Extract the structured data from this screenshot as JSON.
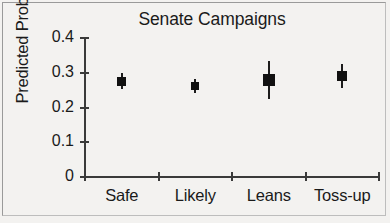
{
  "figure": {
    "title": "Senate Campaigns",
    "ylabel": "Predicted Probability"
  },
  "axes": {
    "y_ticks": [
      "0.4",
      "0.3",
      "0.2",
      "0.1",
      "0"
    ],
    "x_ticks": [
      "Safe",
      "Likely",
      "Leans",
      "Toss-up"
    ]
  },
  "chart_data": {
    "type": "scatter",
    "title": "Senate Campaigns",
    "subtitle": "",
    "xlabel": "",
    "ylabel": "Predicted Probability",
    "categories": [
      "Safe",
      "Likely",
      "Leans",
      "Toss-up"
    ],
    "values": [
      0.275,
      0.262,
      0.278,
      0.29
    ],
    "error_low": [
      0.253,
      0.243,
      0.225,
      0.255
    ],
    "error_high": [
      0.298,
      0.283,
      0.335,
      0.325
    ],
    "ylim": [
      0,
      0.4
    ],
    "ytick_values": [
      0,
      0.1,
      0.2,
      0.3,
      0.4
    ],
    "ytick_labels": [
      "0",
      "0.1",
      "0.2",
      "0.3",
      "0.4"
    ],
    "grid": false,
    "legend": false,
    "legend_position": "none",
    "marker": "filled-square",
    "error_bars": true,
    "series": [
      {
        "name": "Predicted Probability",
        "points": [
          {
            "category": "Safe",
            "value": 0.275,
            "low": 0.253,
            "high": 0.298,
            "marker_size": 9
          },
          {
            "category": "Likely",
            "value": 0.262,
            "low": 0.243,
            "high": 0.283,
            "marker_size": 8
          },
          {
            "category": "Leans",
            "value": 0.278,
            "low": 0.225,
            "high": 0.335,
            "marker_size": 12
          },
          {
            "category": "Toss-up",
            "value": 0.29,
            "low": 0.255,
            "high": 0.325,
            "marker_size": 10
          }
        ]
      }
    ]
  },
  "colors": {
    "marker": "#111111",
    "axis": "#3a3a3a",
    "text": "#1a1a1a",
    "background": "#f3f2f0",
    "border": "#9a9a9a"
  }
}
